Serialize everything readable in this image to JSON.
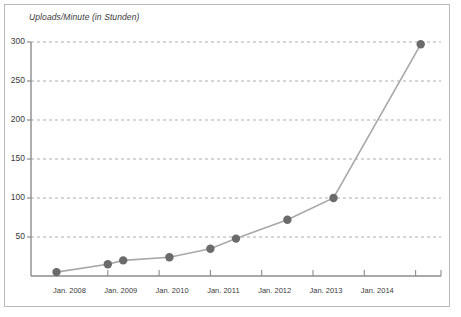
{
  "chart_data": {
    "type": "line",
    "title": "Uploads/Minute (in Stunden)",
    "subtitle": "",
    "xlabel": "",
    "ylabel": "Uploads/Minute (in Stunden)",
    "grid": true,
    "legend": false,
    "legend_position": "none",
    "ylim": [
      0,
      300
    ],
    "ytick_values": [
      50,
      100,
      150,
      200,
      250,
      300
    ],
    "ytick_labels": [
      "50",
      "100",
      "150",
      "200",
      "250",
      "300"
    ],
    "xtick_labels": [
      "Jan. 2008",
      "Jan. 2009",
      "Jan. 2010",
      "Jan. 2011",
      "Jan. 2012",
      "Jan. 2013",
      "Jan. 2014"
    ],
    "x_axis_type": "time",
    "series": [
      {
        "name": "Uploads/Minute",
        "color": "#a8a8a8",
        "marker_color": "#6b6b6b",
        "points": [
          {
            "x_label": "Jan. 2008",
            "x": 2008.0,
            "y": 5
          },
          {
            "x_label": "Jan. 2009",
            "x": 2009.0,
            "y": 15
          },
          {
            "x_label": "Mai 2009",
            "x": 2009.3,
            "y": 20
          },
          {
            "x_label": "Mrz 2010",
            "x": 2010.2,
            "y": 24
          },
          {
            "x_label": "Jan. 2011",
            "x": 2011.0,
            "y": 35
          },
          {
            "x_label": "Mai 2011",
            "x": 2011.5,
            "y": 48
          },
          {
            "x_label": "Jan. 2012",
            "x": 2012.5,
            "y": 72
          },
          {
            "x_label": "Mai 2013",
            "x": 2013.4,
            "y": 100
          },
          {
            "x_label": "Mrz 2015",
            "x": 2015.1,
            "y": 297
          }
        ]
      }
    ]
  },
  "axes": {
    "axis_color": "#8c8c8c",
    "gridline_color": "#9a9a9a",
    "text_color": "#3a3a3a",
    "frame_color": "#b9b9b9"
  }
}
